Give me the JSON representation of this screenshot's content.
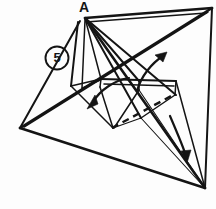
{
  "figure": {
    "kind": "origami-fold-diagram",
    "background_color": "#fdfdfd",
    "ink_color": "#141414",
    "width": 216,
    "height": 209,
    "labels": {
      "apex_label": "A",
      "step_number": "5"
    },
    "geometry": {
      "description": "Three-dimensional origami model in mid-fold: a tall pyramid-like form with a raised apex A, a large flat base triangle, two raised flaps and a hidden dashed crease.",
      "vertices": {
        "apex_A": [
          85,
          18
        ],
        "top_right": [
          212,
          8
        ],
        "left": [
          20,
          128
        ],
        "bottom_right": [
          205,
          188
        ],
        "flap_left_top": [
          78,
          22
        ],
        "flap_left_bottom": [
          71,
          86
        ],
        "mid_left_node": [
          100,
          79
        ],
        "mid_center_node": [
          139,
          80
        ],
        "mid_right_node": [
          173,
          80
        ],
        "lower_center_node": [
          112,
          128
        ],
        "lower_mid_node": [
          140,
          117
        ],
        "right_node": [
          175,
          94
        ]
      },
      "outer_base_triangle": [
        [
          20,
          128
        ],
        [
          212,
          8
        ],
        [
          205,
          188
        ]
      ],
      "dashed_crease": [
        [
          112,
          128
        ],
        [
          172,
          95
        ]
      ],
      "fan_lines_from_apex": [
        [
          [
            85,
            18
          ],
          [
            20,
            128
          ]
        ],
        [
          [
            85,
            18
          ],
          [
            212,
            8
          ]
        ],
        [
          [
            85,
            18
          ],
          [
            205,
            188
          ]
        ],
        [
          [
            85,
            18
          ],
          [
            175,
            94
          ]
        ],
        [
          [
            85,
            18
          ],
          [
            140,
            117
          ]
        ],
        [
          [
            85,
            18
          ],
          [
            100,
            79
          ]
        ],
        [
          [
            85,
            18
          ],
          [
            71,
            86
          ]
        ]
      ]
    },
    "arrows": [
      {
        "name": "fold-arrow-up-right",
        "direction": "up-right",
        "start": [
          139,
          90
        ],
        "end": [
          166,
          54
        ]
      },
      {
        "name": "fold-arrow-down-left",
        "direction": "down-left",
        "start": [
          127,
          79
        ],
        "end": [
          89,
          107
        ]
      },
      {
        "name": "fold-arrow-down-right",
        "direction": "down",
        "start": [
          170,
          118
        ],
        "end": [
          186,
          160
        ]
      }
    ]
  }
}
